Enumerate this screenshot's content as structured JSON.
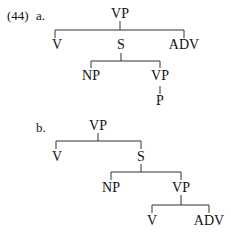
{
  "example": {
    "number": "(44)",
    "a": {
      "label": "a.",
      "root": "VP",
      "children": [
        "V",
        "S",
        "ADV"
      ],
      "s_children": [
        "NP",
        "VP"
      ],
      "vp_children": [
        "P"
      ]
    },
    "b": {
      "label": "b.",
      "root": "VP",
      "children": [
        "V",
        "S"
      ],
      "s_children": [
        "NP",
        "VP"
      ],
      "vp_children": [
        "V",
        "ADV"
      ]
    }
  }
}
